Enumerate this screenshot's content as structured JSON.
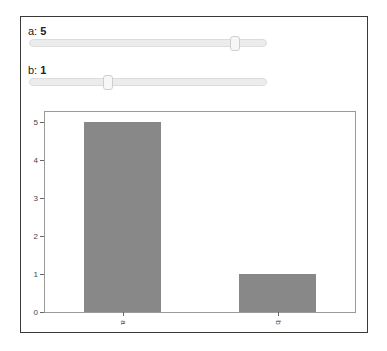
{
  "controls": {
    "sliders": [
      {
        "name": "a",
        "label": "a: ",
        "value": "5",
        "handle_pct": 87
      },
      {
        "name": "b",
        "label": "b: ",
        "value": "1",
        "handle_pct": 33
      }
    ]
  },
  "chart_data": {
    "type": "bar",
    "categories": [
      "a",
      "b"
    ],
    "values": [
      5,
      1
    ],
    "title": "",
    "xlabel": "",
    "ylabel": "",
    "ylim": [
      0,
      5.25
    ],
    "yticks": [
      "0",
      "1",
      "2",
      "3",
      "4",
      "5"
    ],
    "grid": false,
    "legend": null,
    "bar_color": "#888888",
    "xtick_rotation": 90
  }
}
